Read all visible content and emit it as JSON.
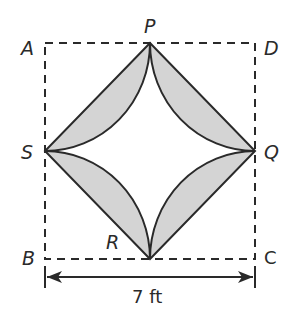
{
  "figure": {
    "labels": {
      "A": "A",
      "B": "B",
      "C": "C",
      "D": "D",
      "P": "P",
      "Q": "Q",
      "R": "R",
      "S": "S"
    },
    "dimension_label": "7 ft",
    "colors": {
      "stroke": "#2a2a2a",
      "shade": "#d4d4d4",
      "background": "#ffffff"
    }
  }
}
